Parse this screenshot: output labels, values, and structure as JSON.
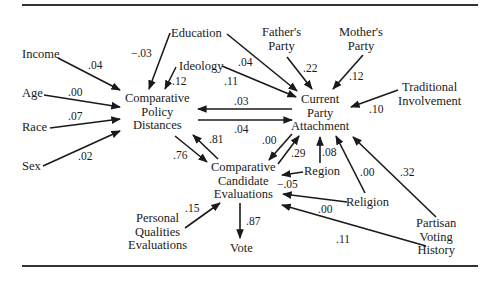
{
  "nodes": {
    "income": {
      "lines": [
        "Income"
      ]
    },
    "age": {
      "lines": [
        "Age"
      ]
    },
    "race": {
      "lines": [
        "Race"
      ]
    },
    "sex": {
      "lines": [
        "Sex"
      ]
    },
    "education": {
      "lines": [
        "Education"
      ]
    },
    "ideology": {
      "lines": [
        "Ideology"
      ]
    },
    "fathers_party": {
      "lines": [
        "Father's",
        "Party"
      ]
    },
    "mothers_party": {
      "lines": [
        "Mother's",
        "Party"
      ]
    },
    "traditional_involvement": {
      "lines": [
        "Traditional",
        "Involvement"
      ]
    },
    "comparative_policy_distances": {
      "lines": [
        "Comparative",
        "Policy",
        "Distances"
      ]
    },
    "current_party_attachment": {
      "lines": [
        "Current",
        "Party",
        "Attachment"
      ]
    },
    "comparative_candidate_evaluations": {
      "lines": [
        "Comparative",
        "Candidate",
        "Evaluations"
      ]
    },
    "region": {
      "lines": [
        "Region"
      ]
    },
    "religion": {
      "lines": [
        "Religion"
      ]
    },
    "personal_qualities_evaluations": {
      "lines": [
        "Personal",
        "Qualities",
        "Evaluations"
      ]
    },
    "vote": {
      "lines": [
        "Vote"
      ]
    },
    "partisan_voting_history": {
      "lines": [
        "Partisan",
        "Voting",
        "History"
      ]
    }
  },
  "paths": [
    {
      "from": "Income",
      "to": "Comparative Policy Distances",
      "coef": ".04"
    },
    {
      "from": "Age",
      "to": "Comparative Policy Distances",
      "coef": ".00"
    },
    {
      "from": "Race",
      "to": "Comparative Policy Distances",
      "coef": ".07"
    },
    {
      "from": "Sex",
      "to": "Comparative Policy Distances",
      "coef": ".02"
    },
    {
      "from": "Education",
      "to": "Comparative Policy Distances",
      "coef": "−.03"
    },
    {
      "from": "Ideology",
      "to": "Comparative Policy Distances",
      "coef": ".12"
    },
    {
      "from": "Education",
      "to": "Current Party Attachment",
      "coef": ".04"
    },
    {
      "from": "Ideology",
      "to": "Current Party Attachment",
      "coef": ".11"
    },
    {
      "from": "Father's Party",
      "to": "Current Party Attachment",
      "coef": ".22"
    },
    {
      "from": "Mother's Party",
      "to": "Current Party Attachment",
      "coef": ".12"
    },
    {
      "from": "Traditional Involvement",
      "to": "Current Party Attachment",
      "coef": ".10"
    },
    {
      "from": "Current Party Attachment",
      "to": "Comparative Policy Distances",
      "coef": ".03"
    },
    {
      "from": "Comparative Policy Distances",
      "to": "Current Party Attachment",
      "coef": ".04"
    },
    {
      "from": "Comparative Candidate Evaluations",
      "to": "Comparative Policy Distances",
      "coef": ".81"
    },
    {
      "from": "Comparative Policy Distances",
      "to": "Comparative Candidate Evaluations",
      "coef": ".76"
    },
    {
      "from": "Current Party Attachment",
      "to": "Comparative Candidate Evaluations",
      "coef": ".00"
    },
    {
      "from": "Comparative Candidate Evaluations",
      "to": "Current Party Attachment",
      "coef": ".29"
    },
    {
      "from": "Region",
      "to": "Current Party Attachment",
      "coef": ".08"
    },
    {
      "from": "Religion",
      "to": "Current Party Attachment",
      "coef": ".00"
    },
    {
      "from": "Partisan Voting History",
      "to": "Current Party Attachment",
      "coef": ".32"
    },
    {
      "from": "Region",
      "to": "Comparative Candidate Evaluations",
      "coef": "−.05"
    },
    {
      "from": "Religion",
      "to": "Comparative Candidate Evaluations",
      "coef": ".00"
    },
    {
      "from": "Partisan Voting History",
      "to": "Comparative Candidate Evaluations",
      "coef": ".11"
    },
    {
      "from": "Personal Qualities Evaluations",
      "to": "Comparative Candidate Evaluations",
      "coef": ".15"
    },
    {
      "from": "Comparative Candidate Evaluations",
      "to": "Vote",
      "coef": ".87"
    }
  ],
  "coefs": {
    "income_cpd": ".04",
    "age_cpd": ".00",
    "race_cpd": ".07",
    "sex_cpd": ".02",
    "edu_cpd": "−.03",
    "ideo_cpd": ".12",
    "edu_cpa": ".04",
    "ideo_cpa": ".11",
    "father_cpa": ".22",
    "mother_cpa": ".12",
    "trad_cpa": ".10",
    "cpa_cpd": ".03",
    "cpd_cpa": ".04",
    "cce_cpd": ".81",
    "cpd_cce": ".76",
    "cpa_cce": ".00",
    "cce_cpa": ".29",
    "region_cpa": ".08",
    "religion_cpa": ".00",
    "pvh_cpa": ".32",
    "region_cce": "−.05",
    "religion_cce": ".00",
    "pvh_cce": ".11",
    "pqe_cce": ".15",
    "cce_vote": ".87"
  }
}
